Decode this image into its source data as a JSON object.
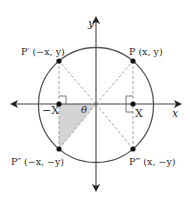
{
  "diagram": {
    "axes": {
      "x_label": "x",
      "y_label": "y"
    },
    "points": {
      "P": {
        "label": "P (x, y)"
      },
      "P_prime": {
        "label": "P′ (−x, y)"
      },
      "P_double_prime": {
        "label": "P″ (−x, −y)"
      },
      "P_triple_prime": {
        "label": "P‴ (x, −y)"
      }
    },
    "foot_labels": {
      "positive": "X",
      "negative": "−X"
    },
    "angle_label": "θ",
    "colors": {
      "stroke": "#555555",
      "dashed": "#999999",
      "shade": "#d4d4d4",
      "point": "#111111",
      "text": "#2a2a2a"
    }
  }
}
